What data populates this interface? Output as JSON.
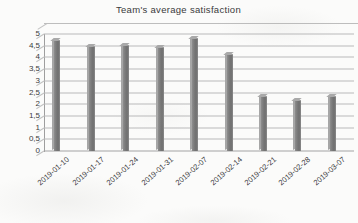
{
  "chart_data": {
    "type": "bar",
    "title": "Team's average satisfaction",
    "xlabel": "",
    "ylabel": "",
    "categories": [
      "2019-01-10",
      "2019-01-17",
      "2019-01-24",
      "2019-01-31",
      "2019-02-07",
      "2019-02-14",
      "2019-02-21",
      "2019-02-28",
      "2019-03-07"
    ],
    "values": [
      4.7,
      4.45,
      4.5,
      4.4,
      4.8,
      4.1,
      2.3,
      2.15,
      2.3
    ],
    "ylim": [
      0,
      5
    ],
    "ytick_labels": [
      "5",
      "4,5",
      "4",
      "3,5",
      "3",
      "2,5",
      "2",
      "1,5",
      "1",
      "0,5",
      "0"
    ],
    "ytick_values": [
      5,
      4.5,
      4,
      3.5,
      3,
      2.5,
      2,
      1.5,
      1,
      0.5,
      0
    ],
    "grid": true,
    "legend": "none",
    "style": "3d-column",
    "bar_color": "#7b7b7b",
    "grid_color": "#b9b9b9",
    "background": "#fbfbfa",
    "decimal_separator": ","
  }
}
